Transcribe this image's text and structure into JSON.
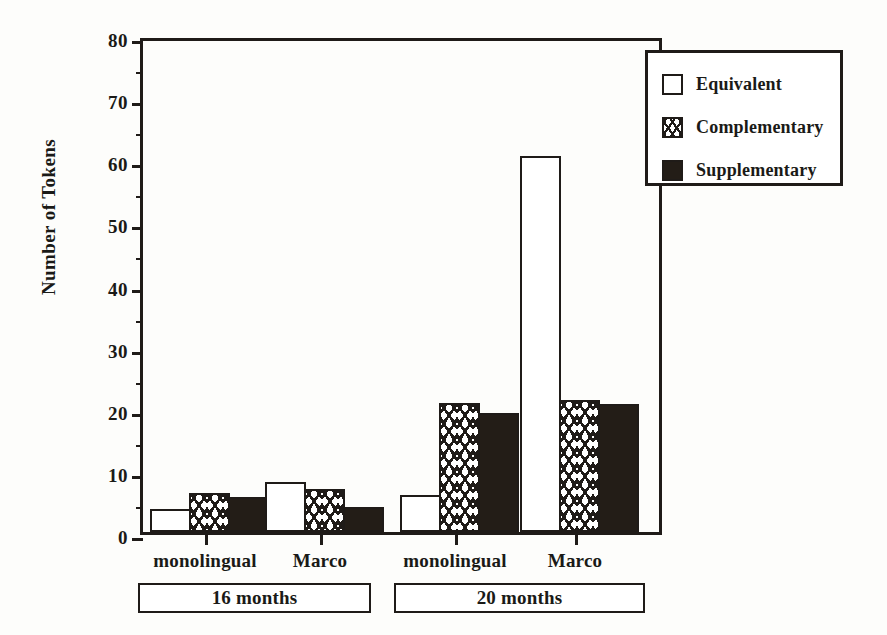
{
  "chart_data": {
    "type": "bar",
    "title": "",
    "xlabel": "",
    "ylabel": "Number of Tokens",
    "ylim": [
      0,
      80
    ],
    "ytick_labels": [
      "0",
      "10",
      "20",
      "30",
      "40",
      "50",
      "60",
      "70",
      "80"
    ],
    "ytick_values": [
      0,
      10,
      20,
      30,
      40,
      50,
      60,
      70,
      80
    ],
    "yminor_values": [
      5,
      15,
      25,
      35,
      45,
      55,
      65,
      75
    ],
    "grid": false,
    "legend_position": "top-right",
    "categories": [
      "monolingual",
      "Marco",
      "monolingual",
      "Marco"
    ],
    "group_spans": [
      {
        "label": "16 months",
        "categories": [
          "monolingual",
          "Marco"
        ]
      },
      {
        "label": "20 months",
        "categories": [
          "monolingual",
          "Marco"
        ]
      }
    ],
    "series": [
      {
        "name": "Equivalent",
        "values": [
          3.7,
          8.1,
          5.9,
          60.5
        ],
        "fill": "white"
      },
      {
        "name": "Complementary",
        "values": [
          6.2,
          7.0,
          20.8,
          21.3
        ],
        "fill": "hatched"
      },
      {
        "name": "Supplementary",
        "values": [
          5.6,
          4.1,
          19.2,
          20.6
        ],
        "fill": "solid-black"
      }
    ]
  },
  "axis": {
    "y_title": "Number of Tokens",
    "ticks": [
      {
        "label": "80",
        "value": 80
      },
      {
        "label": "70",
        "value": 70
      },
      {
        "label": "60",
        "value": 60
      },
      {
        "label": "50",
        "value": 50
      },
      {
        "label": "40",
        "value": 40
      },
      {
        "label": "30",
        "value": 30
      },
      {
        "label": "20",
        "value": 20
      },
      {
        "label": "10",
        "value": 10
      },
      {
        "label": "0",
        "value": 0
      }
    ]
  },
  "legend": {
    "items": [
      {
        "label": "Equivalent",
        "swatch": "equivalent"
      },
      {
        "label": "Complementary",
        "swatch": "complementary"
      },
      {
        "label": "Supplementary",
        "swatch": "supplementary"
      }
    ]
  },
  "x_axis": {
    "labels": [
      {
        "text": "monolingual"
      },
      {
        "text": "Marco"
      },
      {
        "text": "monolingual"
      },
      {
        "text": "Marco"
      }
    ]
  },
  "group_labels": [
    {
      "text": "16 months"
    },
    {
      "text": "20 months"
    }
  ],
  "colors": {
    "ink": "#1f1b18",
    "fill_solid": "#231d17",
    "background": "#fdfdfb",
    "bar_white": "#ffffff"
  }
}
